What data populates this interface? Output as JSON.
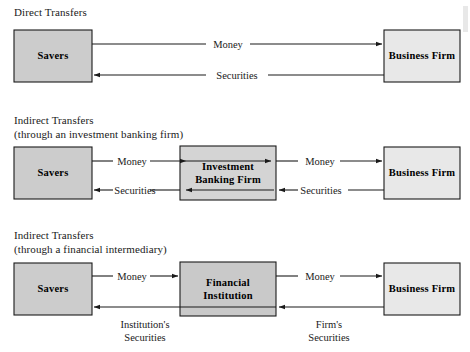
{
  "diagram": {
    "sections": [
      {
        "id": "direct",
        "caption_line1": "Direct Transfers",
        "caption_line2": "",
        "boxes": [
          {
            "id": "savers",
            "label_line1": "Savers",
            "label_line2": "",
            "fill": "#cccccc"
          },
          {
            "id": "business-firm",
            "label_line1": "Business Firm",
            "label_line2": "",
            "fill": "#e8e8e8"
          }
        ],
        "flows": [
          {
            "id": "money",
            "label": "Money",
            "direction": "right"
          },
          {
            "id": "securities",
            "label": "Securities",
            "direction": "left"
          }
        ]
      },
      {
        "id": "indirect-investment-bank",
        "caption_line1": "Indirect Transfers",
        "caption_line2": "(through an investment banking firm)",
        "boxes": [
          {
            "id": "savers",
            "label_line1": "Savers",
            "label_line2": "",
            "fill": "#cccccc"
          },
          {
            "id": "investment-banking-firm",
            "label_line1": "Investment",
            "label_line2": "Banking Firm",
            "fill": "#d4d4d4"
          },
          {
            "id": "business-firm",
            "label_line1": "Business Firm",
            "label_line2": "",
            "fill": "#e8e8e8"
          }
        ],
        "flows": [
          {
            "id": "money-left",
            "label": "Money",
            "direction": "right"
          },
          {
            "id": "money-right",
            "label": "Money",
            "direction": "right"
          },
          {
            "id": "securities-left",
            "label": "Securities",
            "direction": "left"
          },
          {
            "id": "securities-right",
            "label": "Securities",
            "direction": "left"
          }
        ]
      },
      {
        "id": "indirect-financial-intermediary",
        "caption_line1": "Indirect Transfers",
        "caption_line2": "(through a financial intermediary)",
        "boxes": [
          {
            "id": "savers",
            "label_line1": "Savers",
            "label_line2": "",
            "fill": "#cccccc"
          },
          {
            "id": "financial-institution",
            "label_line1": "Financial",
            "label_line2": "Institution",
            "fill": "#c9c9c9"
          },
          {
            "id": "business-firm",
            "label_line1": "Business Firm",
            "label_line2": "",
            "fill": "#e8e8e8"
          }
        ],
        "flows": [
          {
            "id": "money-left",
            "label": "Money",
            "direction": "right"
          },
          {
            "id": "money-right",
            "label": "Money",
            "direction": "right"
          },
          {
            "id": "institutions-securities",
            "label_line1": "Institution's",
            "label_line2": "Securities",
            "direction": "left"
          },
          {
            "id": "firms-securities",
            "label_line1": "Firm's",
            "label_line2": "Securities",
            "direction": "left"
          }
        ]
      }
    ],
    "colors": {
      "stroke": "#1a1a1a",
      "text": "#1a1a1a",
      "background": "#ffffff",
      "savers_fill": "#cccccc",
      "business_fill": "#e8e8e8",
      "intermediary_fill": "#cfcfcf"
    }
  }
}
